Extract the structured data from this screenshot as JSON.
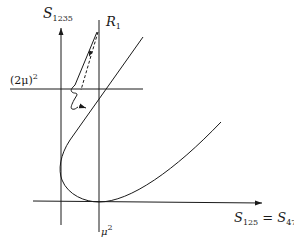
{
  "diagram": {
    "y_axis": {
      "symbol": "S",
      "subscript": "1235"
    },
    "x_axis": {
      "symbol": "S",
      "subscript": "125",
      "eq": " = ",
      "symbol2": "S",
      "subscript2": "478"
    },
    "hline_label": {
      "base": "(2μ)",
      "sup": "2"
    },
    "vline_label": {
      "base": "μ",
      "sup": "2"
    },
    "point_label": {
      "symbol": "R",
      "subscript": "1"
    },
    "colors": {
      "stroke": "#1a1a1a",
      "background": "#ffffff"
    }
  }
}
